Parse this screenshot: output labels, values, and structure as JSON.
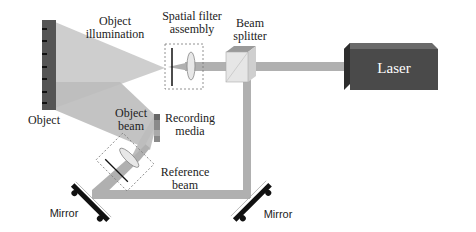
{
  "diagram": {
    "type": "holography-setup",
    "labels": {
      "object_illumination": [
        "Object",
        "illumination"
      ],
      "spatial_filter": [
        "Spatial filter",
        "assembly"
      ],
      "beam_splitter": [
        "Beam",
        "splitter"
      ],
      "laser": "Laser",
      "object": "Object",
      "object_beam": [
        "Object",
        "beam"
      ],
      "recording_media": [
        "Recording",
        "media"
      ],
      "reference_beam": [
        "Reference",
        "beam"
      ],
      "mirror_left": "Mirror",
      "mirror_right": "Mirror"
    },
    "colors": {
      "beam": "#b3b3b3",
      "illumination": "#c4c4c4",
      "laser_body": "#4a4a4a",
      "laser_top": "#6a6a6a",
      "object_plate": "#555555",
      "mirror": "#111111",
      "text": "#222222"
    }
  }
}
